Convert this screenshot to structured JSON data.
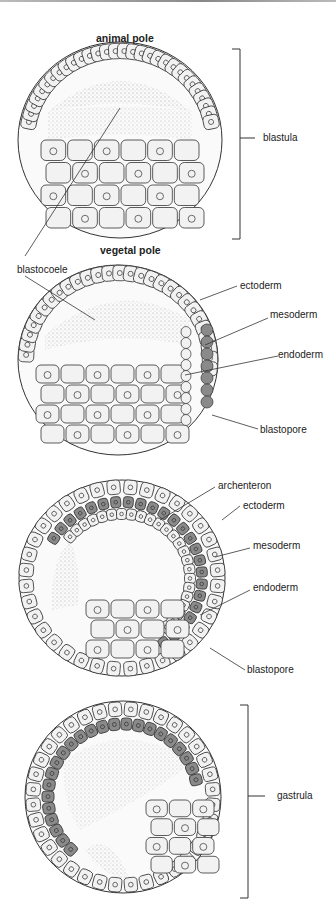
{
  "figure": {
    "stages": [
      {
        "name": "blastula",
        "labels": {
          "top": "animal pole",
          "bottom": "vegetal pole",
          "bracket": "blastula",
          "pointer": "blastocoele"
        }
      },
      {
        "name": "early-gastrula",
        "labels": [
          "ectoderm",
          "mesoderm",
          "endoderm",
          "blastopore"
        ]
      },
      {
        "name": "mid-gastrula",
        "labels": [
          "archenteron",
          "ectoderm",
          "mesoderm",
          "endoderm",
          "blastopore"
        ]
      },
      {
        "name": "gastrula",
        "labels": {
          "bracket": "gastrula"
        }
      }
    ],
    "colors": {
      "outline": "#333333",
      "cell_fill": "#f2f2f2",
      "mesoderm_fill": "#8a8a8a",
      "stipple": "#555555"
    }
  }
}
